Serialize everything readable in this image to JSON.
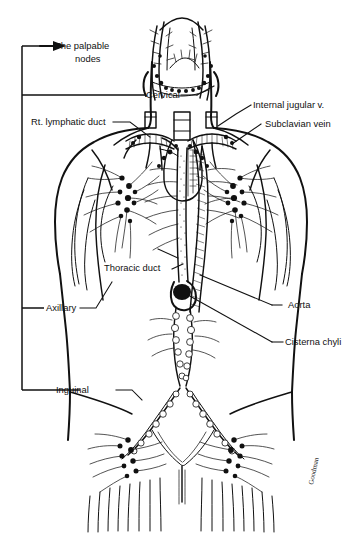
{
  "figure": {
    "background_color": "#ffffff",
    "ink_color": "#111111",
    "signature": "Goodman"
  },
  "bracket": {
    "name": "palpable-nodes-bracket",
    "arrow_label_line1": "The palpable",
    "arrow_label_line2": "nodes",
    "tick_labels": [
      "Cervical",
      "Axillary",
      "Inguinal"
    ]
  },
  "labels": {
    "palpable_nodes_1": "The palpable",
    "palpable_nodes_2": "nodes",
    "cervical": "Cervical",
    "rt_lymphatic_duct": "Rt. lymphatic duct",
    "internal_jugular_v": "Internal jugular v.",
    "subclavian_vein": "Subclavian vein",
    "thoracic_duct": "Thoracic duct",
    "axillary": "Axillary",
    "aorta": "Aorta",
    "cisterna_chyli": "Cisterna chyli",
    "inguinal": "Inguinal"
  },
  "anatomy_groups": [
    {
      "name": "head-and-neck-lymphatics",
      "side": "both"
    },
    {
      "name": "cervical-node-chain",
      "side": "both"
    },
    {
      "name": "supraclavicular-vessels",
      "side": "both"
    },
    {
      "name": "axillary-node-cluster",
      "side": "both"
    },
    {
      "name": "thoracic-duct",
      "side": "left"
    },
    {
      "name": "aorta",
      "side": "center"
    },
    {
      "name": "cisterna-chyli",
      "side": "center"
    },
    {
      "name": "lumbar-node-chain",
      "side": "center"
    },
    {
      "name": "iliac-node-chain",
      "side": "both"
    },
    {
      "name": "inguinal-node-cluster",
      "side": "both"
    },
    {
      "name": "torso-outline",
      "side": "both"
    }
  ]
}
